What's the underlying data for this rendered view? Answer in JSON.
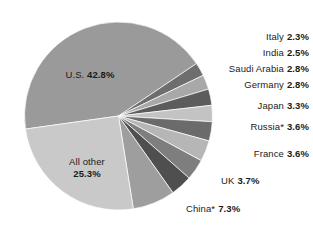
{
  "chart_data": {
    "type": "pie",
    "title": "",
    "subtitle": "",
    "xlabel": "",
    "ylabel": "",
    "legend_position": "callout-labels",
    "grid": false,
    "unit": "%",
    "categories": [
      "U.S.",
      "Italy",
      "India",
      "Saudi Arabia",
      "Germany",
      "Japan",
      "Russia*",
      "France",
      "UK",
      "China*",
      "All other"
    ],
    "values": [
      42.8,
      2.3,
      2.5,
      2.8,
      2.8,
      3.3,
      3.6,
      3.6,
      3.7,
      7.3,
      25.3
    ],
    "slices": [
      {
        "label": "U.S.",
        "value": 42.8,
        "display": "42.8%",
        "color": "#9a9a9a",
        "label_placement": "inside"
      },
      {
        "label": "Italy",
        "value": 2.3,
        "display": "2.3%",
        "color": "#6e6e6e",
        "label_placement": "callout"
      },
      {
        "label": "India",
        "value": 2.5,
        "display": "2.5%",
        "color": "#a8a8a8",
        "label_placement": "callout"
      },
      {
        "label": "Saudi Arabia",
        "value": 2.8,
        "display": "2.8%",
        "color": "#5c5c5c",
        "label_placement": "callout"
      },
      {
        "label": "Germany",
        "value": 2.8,
        "display": "2.8%",
        "color": "#c3c3c3",
        "label_placement": "callout"
      },
      {
        "label": "Japan",
        "value": 3.3,
        "display": "3.3%",
        "color": "#6b6b6b",
        "label_placement": "callout"
      },
      {
        "label": "Russia*",
        "value": 3.6,
        "display": "3.6%",
        "color": "#b6b6b6",
        "label_placement": "callout"
      },
      {
        "label": "France",
        "value": 3.6,
        "display": "3.6%",
        "color": "#7e7e7e",
        "label_placement": "callout"
      },
      {
        "label": "UK",
        "value": 3.7,
        "display": "3.7%",
        "color": "#4f4f4f",
        "label_placement": "callout"
      },
      {
        "label": "China*",
        "value": 7.3,
        "display": "7.3%",
        "color": "#9e9e9e",
        "label_placement": "callout"
      },
      {
        "label": "All other",
        "value": 25.3,
        "display": "25.3%",
        "color": "#c9c9c9",
        "label_placement": "inside"
      }
    ]
  },
  "pie": {
    "inside_labels": {
      "us": {
        "name": "U.S.",
        "pct": "42.8%"
      },
      "all_other": {
        "name": "All other",
        "pct": "25.3%"
      }
    },
    "callouts": {
      "italy": {
        "name": "Italy",
        "pct": "2.3%"
      },
      "india": {
        "name": "India",
        "pct": "2.5%"
      },
      "saudi_arabia": {
        "name": "Saudi Arabia",
        "pct": "2.8%"
      },
      "germany": {
        "name": "Germany",
        "pct": "2.8%"
      },
      "japan": {
        "name": "Japan",
        "pct": "3.3%"
      },
      "russia": {
        "name": "Russia*",
        "pct": "3.6%"
      },
      "france": {
        "name": "France",
        "pct": "3.6%"
      },
      "uk": {
        "name": "UK",
        "pct": "3.7%"
      },
      "china": {
        "name": "China*",
        "pct": "7.3%"
      }
    }
  },
  "colors": {
    "background": "#ffffff",
    "text": "#1b1b1b",
    "us_slice": "#9a9a9a",
    "all_other_slice": "#c9c9c9"
  }
}
